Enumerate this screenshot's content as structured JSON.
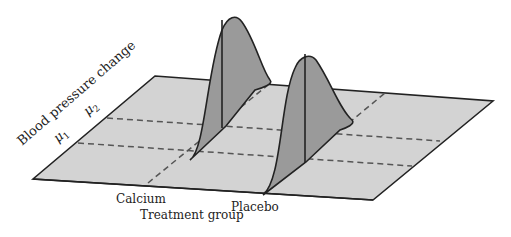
{
  "diagram": {
    "type": "3d-normal-distributions-on-plane",
    "axes": {
      "y_axis_label": "Blood pressure change",
      "x_axis_label": "Treatment group"
    },
    "y_ticks": [
      {
        "label": "μ",
        "subscript": "1"
      },
      {
        "label": "μ",
        "subscript": "2"
      }
    ],
    "groups": [
      {
        "label": "Calcium",
        "mean": "μ2"
      },
      {
        "label": "Placebo",
        "mean": "μ1"
      }
    ],
    "colors": {
      "plane": "#d3d3d3",
      "curve_fill": "#9a9a9a",
      "outline": "#222222",
      "dashed": "#555555"
    }
  }
}
